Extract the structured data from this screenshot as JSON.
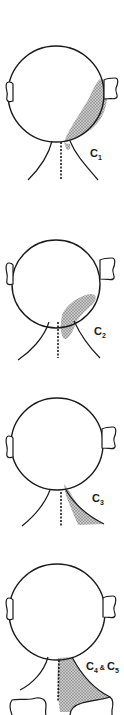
{
  "diagram": {
    "type": "dermatome-head-neck",
    "stroke_color": "#1a1a1a",
    "shade_color": "#a8a8a8",
    "panels": [
      {
        "label_main": "C",
        "label_sub": "1",
        "label_full": "C1",
        "region": "occipital scalp (back of head, right side) extending to upper neck"
      },
      {
        "label_main": "C",
        "label_sub": "2",
        "label_full": "C2",
        "region": "upper neck below jaw/occiput"
      },
      {
        "label_main": "C",
        "label_sub": "3",
        "label_full": "C3",
        "region": "side of neck"
      },
      {
        "label_main": "C",
        "label_sub": "4",
        "label_amp": "&",
        "label_main2": "C",
        "label_sub2": "5",
        "label_full": "C4 & C5",
        "region": "lower neck to shoulder"
      }
    ]
  }
}
